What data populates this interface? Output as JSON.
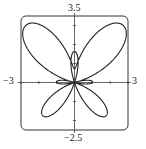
{
  "chart_data": {
    "type": "line",
    "subtype": "polar",
    "title": "",
    "equation": "r = e^(sin θ) − 2cos(4θ)",
    "theta_range": [
      0,
      6.2832
    ],
    "xlim": [
      -3,
      3
    ],
    "ylim": [
      -2.5,
      3.5
    ],
    "tick_labels": {
      "xmin": "−3",
      "xmax": "3",
      "ymin": "−2.5",
      "ymax": "3.5"
    },
    "grid": false,
    "axes": true,
    "line_color": "#222222"
  }
}
